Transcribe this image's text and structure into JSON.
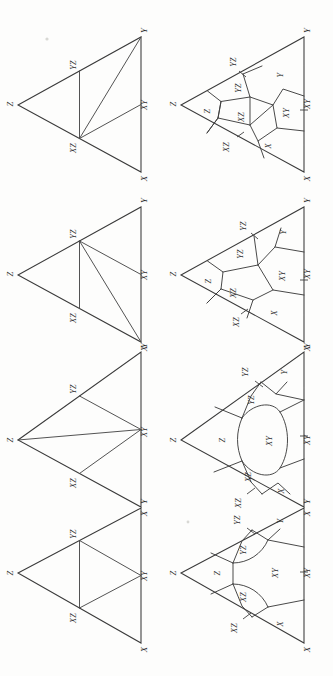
{
  "figure": {
    "orientation_degrees": 90,
    "stroke_color": "#3a3a3a",
    "background_color": "#fdfdfc",
    "vertex_labels": {
      "x": "X",
      "y": "Y",
      "z": "Z",
      "xy": "XY",
      "yz": "YZ",
      "xz": "XZ"
    },
    "region_labels": {
      "x": "X",
      "y": "Y",
      "z": "Z",
      "xy": "XY",
      "yz": "YZ",
      "xz": "XZ"
    },
    "rows": [
      {
        "id": "row-1",
        "left": {
          "name": "triangulation-1",
          "vertices": [
            "Z",
            "Y",
            "X"
          ],
          "edge_midpoints": [
            "YZ",
            "XY",
            "XZ"
          ],
          "internal_edges": [
            "YZ-XZ",
            "XZ-XY",
            "XZ-Y"
          ]
        },
        "right": {
          "name": "cell-decomposition-1",
          "corner_cells": [
            "Z",
            "Y",
            "X"
          ],
          "edge_cells": [
            "YZ",
            "XY",
            "XZ"
          ],
          "center_cell": null
        }
      },
      {
        "id": "row-2",
        "left": {
          "name": "triangulation-2",
          "vertices": [
            "Z",
            "Y",
            "X"
          ],
          "edge_midpoints": [
            "YZ",
            "XY",
            "XZ"
          ],
          "internal_edges": [
            "YZ-XZ",
            "YZ-XY",
            "YZ-X"
          ]
        },
        "right": {
          "name": "cell-decomposition-2",
          "corner_cells": [
            "Z",
            "Y",
            "X"
          ],
          "edge_cells": [
            "YZ",
            "XY",
            "XZ"
          ],
          "center_cell": null
        }
      },
      {
        "id": "row-3",
        "left": {
          "name": "triangulation-3",
          "vertices": [
            "Z",
            "Y",
            "X"
          ],
          "edge_midpoints": [
            "YZ",
            "XY",
            "XZ"
          ],
          "internal_edges": [
            "YZ-XY",
            "XZ-XY",
            "Z-XY"
          ]
        },
        "right": {
          "name": "cell-decomposition-3",
          "corner_cells": [
            "Z",
            "Y",
            "X"
          ],
          "edge_cells": [
            "YZ",
            "XY",
            "XZ"
          ],
          "center_cell": null
        }
      },
      {
        "id": "row-4",
        "left": {
          "name": "triangulation-4",
          "vertices": [
            "Z",
            "Y",
            "X"
          ],
          "edge_midpoints": [
            "YZ",
            "XY",
            "XZ"
          ],
          "internal_edges": [
            "YZ-XZ",
            "YZ-XY",
            "XZ-XY"
          ]
        },
        "right": {
          "name": "cell-decomposition-4",
          "corner_cells": [
            "Z",
            "Y",
            "X"
          ],
          "edge_cells": [
            "YZ",
            "XY",
            "XZ"
          ],
          "center_cell": null
        }
      }
    ]
  }
}
